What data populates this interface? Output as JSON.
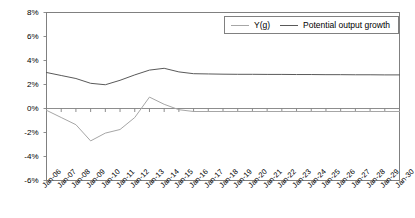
{
  "chart_data": {
    "type": "line",
    "title": "",
    "xlabel": "",
    "ylabel": "",
    "ylim": [
      -6,
      8
    ],
    "ytick_format": "percent",
    "grid": false,
    "legend_position": "top-right",
    "categories": [
      "Jan-06",
      "Jan-07",
      "Jan-08",
      "Jan-09",
      "Jan-10",
      "Jan-11",
      "Jan-12",
      "Jan-13",
      "Jan-14",
      "Jan-15",
      "Jan-16",
      "Jan-17",
      "Jan-18",
      "Jan-19",
      "Jan-20",
      "Jan-21",
      "Jan-22",
      "Jan-23",
      "Jan-24",
      "Jan-25",
      "Jan-26",
      "Jan-27",
      "Jan-28",
      "Jan-29",
      "Jan-30"
    ],
    "yticks": [
      8,
      6,
      4,
      2,
      0,
      -2,
      -4,
      -6
    ],
    "ytick_labels": [
      "8%",
      "6%",
      "4%",
      "2%",
      "0%",
      "-2%",
      "-4%",
      "-6%"
    ],
    "series": [
      {
        "name": "Y(g)",
        "color": "#a6a6a6",
        "values": [
          -0.15,
          -0.75,
          -1.35,
          -2.7,
          -2.05,
          -1.75,
          -0.75,
          0.95,
          0.35,
          -0.1,
          -0.25,
          -0.25,
          -0.25,
          -0.25,
          -0.25,
          -0.25,
          -0.25,
          -0.25,
          -0.25,
          -0.25,
          -0.25,
          -0.25,
          -0.25,
          -0.25,
          -0.25
        ]
      },
      {
        "name": "Potential output growth",
        "color": "#595959",
        "values": [
          3.0,
          2.75,
          2.5,
          2.1,
          1.98,
          2.35,
          2.8,
          3.2,
          3.35,
          3.05,
          2.9,
          2.88,
          2.86,
          2.85,
          2.85,
          2.84,
          2.84,
          2.83,
          2.83,
          2.82,
          2.82,
          2.81,
          2.81,
          2.8,
          2.8
        ]
      }
    ]
  },
  "legend": {
    "items": [
      {
        "label": "Y(g)"
      },
      {
        "label": "Potential output growth"
      }
    ]
  },
  "colors": {
    "series_grey": "#a6a6a6",
    "series_dark": "#595959",
    "axis": "#808080",
    "background": "#ffffff"
  }
}
